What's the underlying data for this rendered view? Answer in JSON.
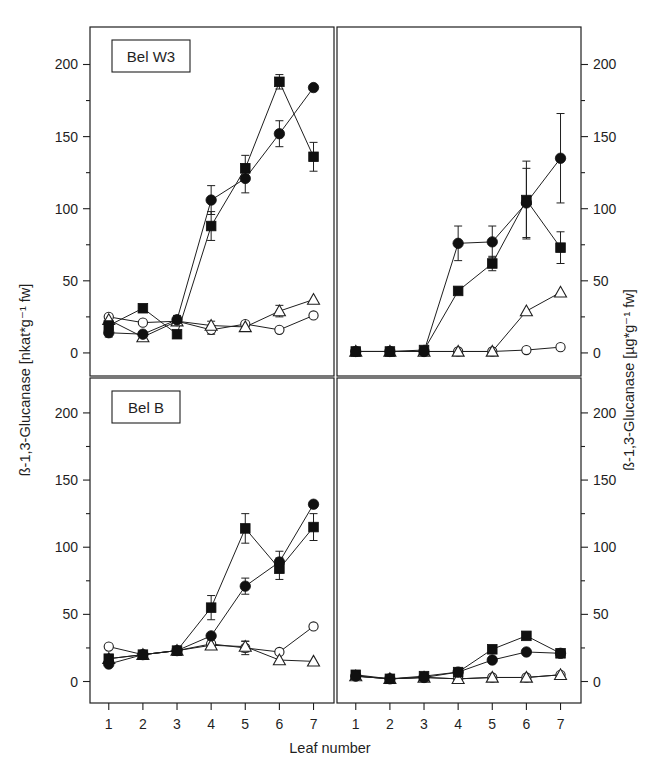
{
  "figure": {
    "xlabel": "Leaf number",
    "ylabel_left": "ß-1,3-Glucanase [nkat*g⁻¹ fw]",
    "ylabel_right": "ß-1,3-Glucanase [µg*g⁻¹ fw]",
    "panel_label_top": "Bel W3",
    "panel_label_bottom": "Bel B",
    "ytick_labels": [
      "0",
      "50",
      "100",
      "150",
      "200"
    ],
    "xtick_labels": [
      "1",
      "2",
      "3",
      "4",
      "5",
      "6",
      "7"
    ],
    "line_color": "#1f1f1f",
    "background": "#ffffff"
  },
  "chart_data": [
    {
      "id": "top-left",
      "type": "line",
      "title": "Bel W3",
      "panel_label": "Bel W3",
      "xlabel": "Leaf number",
      "ylabel": "ß-1,3-Glucanase [nkat*g⁻¹ fw]",
      "x": [
        1,
        2,
        3,
        4,
        5,
        6,
        7
      ],
      "xlim": [
        0.5,
        7.5
      ],
      "ylim": [
        -15,
        225
      ],
      "yticks": [
        0,
        50,
        100,
        150,
        200
      ],
      "grid": false,
      "legend": "none",
      "series": [
        {
          "name": "filled-square",
          "marker": "filled square",
          "values": [
            19,
            31,
            13,
            88,
            128,
            188,
            136
          ],
          "errors": [
            3,
            0,
            0,
            10,
            9,
            5,
            10
          ]
        },
        {
          "name": "filled-circle",
          "marker": "filled circle",
          "values": [
            14,
            13,
            23,
            106,
            121,
            152,
            184
          ],
          "errors": [
            3,
            0,
            3,
            10,
            10,
            9,
            0
          ]
        },
        {
          "name": "open-circle",
          "marker": "open circle",
          "values": [
            25,
            21,
            22,
            16,
            20,
            16,
            26
          ],
          "errors": [
            0,
            0,
            0,
            3,
            0,
            0,
            0
          ]
        },
        {
          "name": "open-triangle",
          "marker": "open triangle",
          "values": [
            23,
            11,
            22,
            19,
            18,
            29,
            37
          ],
          "errors": [
            0,
            0,
            0,
            3,
            0,
            4,
            0
          ]
        }
      ]
    },
    {
      "id": "top-right",
      "type": "line",
      "title": "",
      "panel_label": "",
      "xlabel": "Leaf number",
      "ylabel": "ß-1,3-Glucanase [µg*g⁻¹ fw]",
      "x": [
        1,
        2,
        3,
        4,
        5,
        6,
        7
      ],
      "xlim": [
        0.5,
        7.5
      ],
      "ylim": [
        -15,
        225
      ],
      "yticks": [
        0,
        50,
        100,
        150,
        200
      ],
      "grid": false,
      "legend": "none",
      "series": [
        {
          "name": "filled-square",
          "marker": "filled square",
          "values": [
            1,
            1,
            2,
            43,
            62,
            106,
            73
          ],
          "errors": [
            0,
            0,
            0,
            0,
            5,
            27,
            11
          ]
        },
        {
          "name": "filled-circle",
          "marker": "filled circle",
          "values": [
            1,
            1,
            1,
            76,
            77,
            104,
            135
          ],
          "errors": [
            0,
            0,
            0,
            12,
            11,
            24,
            31
          ]
        },
        {
          "name": "open-circle",
          "marker": "open circle",
          "values": [
            1,
            1,
            1,
            1,
            1,
            2,
            4
          ],
          "errors": [
            0,
            0,
            0,
            0,
            0,
            0,
            0
          ]
        },
        {
          "name": "open-triangle",
          "marker": "open triangle",
          "values": [
            1,
            1,
            1,
            1,
            1,
            29,
            42
          ],
          "errors": [
            0,
            0,
            0,
            0,
            0,
            0,
            0
          ]
        }
      ]
    },
    {
      "id": "bottom-left",
      "type": "line",
      "title": "Bel B",
      "panel_label": "Bel B",
      "xlabel": "Leaf number",
      "ylabel": "ß-1,3-Glucanase [nkat*g⁻¹ fw]",
      "x": [
        1,
        2,
        3,
        4,
        5,
        6,
        7
      ],
      "xlim": [
        0.5,
        7.5
      ],
      "ylim": [
        -15,
        225
      ],
      "yticks": [
        0,
        50,
        100,
        150,
        200
      ],
      "grid": false,
      "legend": "none",
      "series": [
        {
          "name": "filled-square",
          "marker": "filled square",
          "values": [
            17,
            20,
            23,
            55,
            114,
            84,
            115
          ],
          "errors": [
            0,
            0,
            0,
            9,
            11,
            8,
            10
          ]
        },
        {
          "name": "filled-circle",
          "marker": "filled circle",
          "values": [
            13,
            20,
            23,
            34,
            71,
            89,
            132
          ],
          "errors": [
            0,
            0,
            0,
            0,
            6,
            8,
            0
          ]
        },
        {
          "name": "open-circle",
          "marker": "open circle",
          "values": [
            26,
            20,
            23,
            28,
            25,
            22,
            41
          ],
          "errors": [
            0,
            0,
            0,
            0,
            5,
            0,
            0
          ]
        },
        {
          "name": "open-triangle",
          "marker": "open triangle",
          "values": [
            17,
            20,
            23,
            27,
            26,
            16,
            15
          ],
          "errors": [
            0,
            0,
            0,
            3,
            4,
            0,
            0
          ]
        }
      ]
    },
    {
      "id": "bottom-right",
      "type": "line",
      "title": "",
      "panel_label": "",
      "xlabel": "Leaf number",
      "ylabel": "ß-1,3-Glucanase [µg*g⁻¹ fw]",
      "x": [
        1,
        2,
        3,
        4,
        5,
        6,
        7
      ],
      "xlim": [
        0.5,
        7.5
      ],
      "ylim": [
        -15,
        225
      ],
      "yticks": [
        0,
        50,
        100,
        150,
        200
      ],
      "grid": false,
      "legend": "none",
      "series": [
        {
          "name": "filled-square",
          "marker": "filled square",
          "values": [
            5,
            2,
            4,
            7,
            24,
            34,
            21
          ],
          "errors": [
            0,
            0,
            0,
            0,
            0,
            0,
            0
          ]
        },
        {
          "name": "filled-circle",
          "marker": "filled circle",
          "values": [
            4,
            2,
            3,
            7,
            16,
            22,
            21
          ],
          "errors": [
            0,
            0,
            0,
            0,
            0,
            0,
            0
          ]
        },
        {
          "name": "open-circle",
          "marker": "open circle",
          "values": [
            4,
            2,
            3,
            2,
            3,
            3,
            5
          ],
          "errors": [
            0,
            0,
            0,
            0,
            0,
            0,
            0
          ]
        },
        {
          "name": "open-triangle",
          "marker": "open triangle",
          "values": [
            4,
            2,
            3,
            2,
            3,
            3,
            5
          ],
          "errors": [
            0,
            0,
            0,
            0,
            0,
            0,
            0
          ]
        }
      ]
    }
  ]
}
